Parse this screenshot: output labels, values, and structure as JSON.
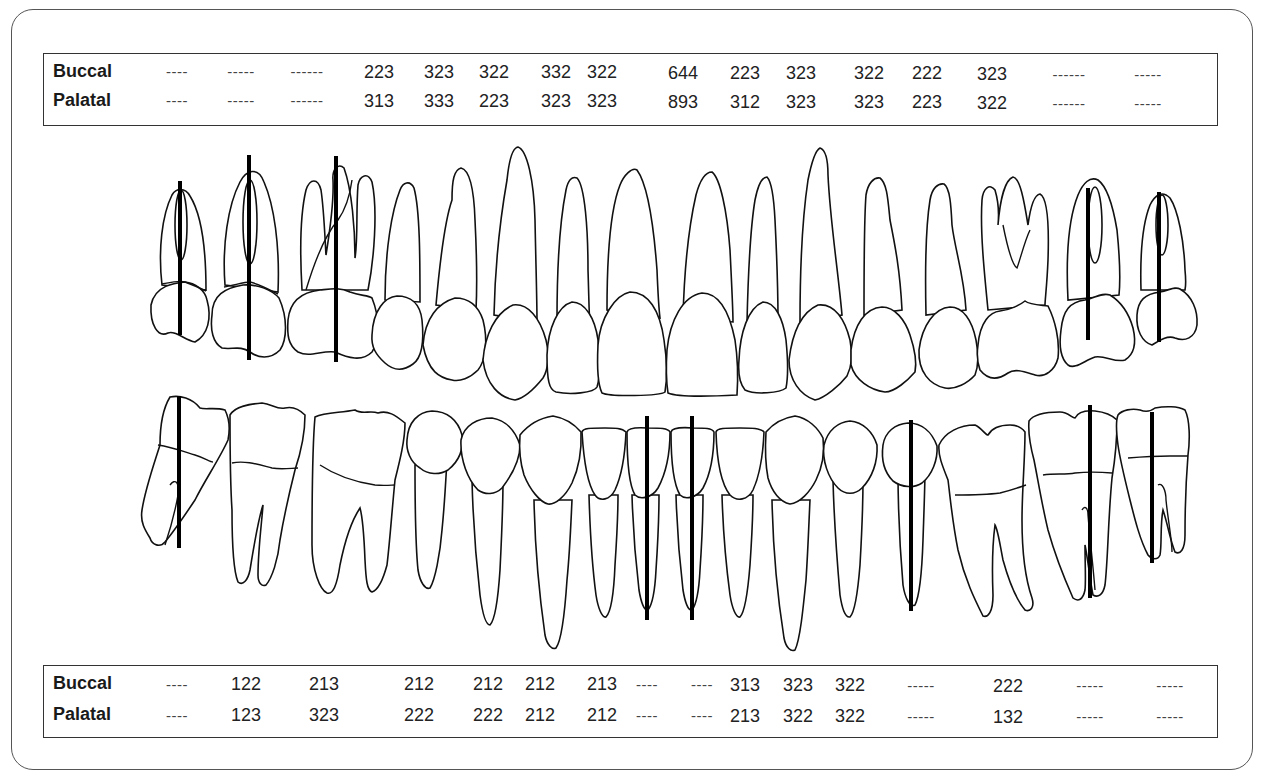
{
  "upper_table": {
    "rows": [
      {
        "label": "Buccal",
        "values": [
          "----",
          "-----",
          "------",
          "223",
          "323",
          "322",
          "332",
          "322",
          "644",
          "223",
          "323",
          "322",
          "222",
          "323",
          "------",
          "-----"
        ]
      },
      {
        "label": "Palatal",
        "values": [
          "----",
          "-----",
          "------",
          "313",
          "333",
          "223",
          "323",
          "323",
          "893",
          "312",
          "323",
          "323",
          "223",
          "322",
          "------",
          "-----"
        ]
      }
    ]
  },
  "lower_table": {
    "rows": [
      {
        "label": "Buccal",
        "values": [
          "----",
          "122",
          "213",
          "212",
          "212",
          "212",
          "213",
          "----",
          "----",
          "313",
          "323",
          "322",
          "-----",
          "222",
          "-----",
          "-----"
        ]
      },
      {
        "label": "Palatal",
        "values": [
          "----",
          "123",
          "323",
          "222",
          "222",
          "212",
          "212",
          "----",
          "----",
          "213",
          "322",
          "322",
          "-----",
          "132",
          "-----",
          "-----"
        ]
      }
    ]
  },
  "diagram": {
    "upper_missing_teeth_positions": [
      1,
      2,
      3,
      15,
      16
    ],
    "lower_missing_teeth_positions": [
      1,
      8,
      9,
      13,
      15,
      16
    ],
    "marker_color": "#000000",
    "outline_color": "#111111"
  }
}
